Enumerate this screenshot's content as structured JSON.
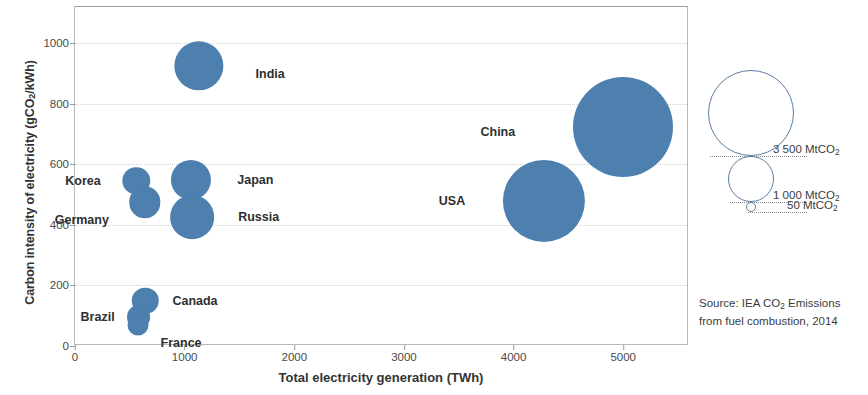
{
  "chart_data": {
    "type": "scatter",
    "title": "",
    "xlabel": "Total electricity generation (TWh)",
    "ylabel_parts": {
      "pre": "Carbon intensity of electricity (gCO",
      "sub": "2",
      "post": "/kWh)"
    },
    "ylabel": "Carbon intensity of electricity (gCO2/kWh)",
    "xlim": [
      0,
      5600
    ],
    "ylim": [
      0,
      1120
    ],
    "xticks": [
      0,
      1000,
      2000,
      3000,
      4000,
      5000
    ],
    "yticks": [
      0,
      200,
      400,
      600,
      800,
      1000
    ],
    "xtick_labels": [
      "0",
      "1000",
      "2000",
      "3000",
      "4000",
      "5000"
    ],
    "ytick_labels": [
      "0",
      "200",
      "400",
      "600",
      "800",
      "1000"
    ],
    "grid": true,
    "legend_position": "right-outside",
    "bubble_color": "#4d7faf",
    "size_units": "MtCO2",
    "points": [
      {
        "name": "India",
        "x": 1130,
        "y": 925,
        "size": 1870,
        "label_side": "right",
        "label_dx": 32,
        "label_dy": 8
      },
      {
        "name": "China",
        "x": 5000,
        "y": 725,
        "size": 7700,
        "label_side": "left",
        "label_dx": -58,
        "label_dy": 5
      },
      {
        "name": "Korea",
        "x": 560,
        "y": 545,
        "size": 580,
        "label_side": "left",
        "label_dx": -22,
        "label_dy": 0
      },
      {
        "name": "Japan",
        "x": 1060,
        "y": 550,
        "size": 1240,
        "label_side": "right",
        "label_dx": 26,
        "label_dy": 0
      },
      {
        "name": "Germany",
        "x": 635,
        "y": 475,
        "size": 760,
        "label_side": "left",
        "label_dx": -20,
        "label_dy": 18
      },
      {
        "name": "USA",
        "x": 4280,
        "y": 480,
        "size": 5200,
        "label_side": "left",
        "label_dx": -38,
        "label_dy": 0
      },
      {
        "name": "Russia",
        "x": 1070,
        "y": 425,
        "size": 1470,
        "label_side": "right",
        "label_dx": 24,
        "label_dy": 0
      },
      {
        "name": "Canada",
        "x": 640,
        "y": 150,
        "size": 540,
        "label_side": "right",
        "label_dx": 14,
        "label_dy": 0
      },
      {
        "name": "Brazil",
        "x": 580,
        "y": 95,
        "size": 440,
        "label_side": "left",
        "label_dx": -12,
        "label_dy": 0
      },
      {
        "name": "France",
        "x": 575,
        "y": 70,
        "size": 340,
        "label_side": "right",
        "label_dx": 12,
        "label_dy": 18
      }
    ]
  },
  "size_legend": {
    "items": [
      {
        "value": "3 500",
        "unit": "MtCO",
        "sub": "2",
        "label": "3 500 MtCO2",
        "r": 43
      },
      {
        "value": "1 000",
        "unit": "MtCO",
        "sub": "2",
        "label": "1 000 MtCO2",
        "r": 23
      },
      {
        "value": "50",
        "unit": "MtCO",
        "sub": "2",
        "label": "50 MtCO2",
        "r": 5
      }
    ]
  },
  "source": {
    "line1_pre": "Source: IEA CO",
    "line1_sub": "2",
    "line1_post": " Emissions",
    "line2": "from fuel combustion, 2014",
    "full": "Source: IEA CO2 Emissions from fuel combustion, 2014"
  }
}
